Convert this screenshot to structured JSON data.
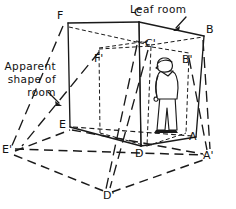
{
  "figure": {
    "type": "perspective-geometry-diagram",
    "background_color": "#ffffff",
    "ink_color": "#1a1a1a",
    "annotations": {
      "leaf_room": {
        "label": "Leaf room",
        "arrow": "points down-left to the ceiling edge near corner C-B"
      },
      "apparent_shape": {
        "line1": "Apparent",
        "line2": "shape of",
        "line3": "room",
        "arrow": "points down-right to the dashed projected outline"
      }
    },
    "vertices": [
      {
        "id": "C",
        "label": "C",
        "x": 139,
        "y": 22,
        "kind": "true-room-ceiling-back"
      },
      {
        "id": "F",
        "label": "F",
        "x": 68,
        "y": 23,
        "kind": "true-room-ceiling-left"
      },
      {
        "id": "B",
        "label": "B",
        "x": 204,
        "y": 36,
        "kind": "true-room-ceiling-right"
      },
      {
        "id": "E",
        "label": "E",
        "x": 70,
        "y": 127,
        "kind": "true-room-floor-left"
      },
      {
        "id": "D",
        "label": "D",
        "x": 141,
        "y": 146,
        "kind": "true-room-floor-back"
      },
      {
        "id": "A",
        "label": "A",
        "x": 196,
        "y": 137,
        "kind": "true-room-floor-right"
      },
      {
        "id": "Fp",
        "label": "F'",
        "x": 101,
        "y": 54,
        "kind": "projected-ceiling-left"
      },
      {
        "id": "Cp",
        "label": "C'",
        "x": 151,
        "y": 47,
        "kind": "projected-ceiling-back"
      },
      {
        "id": "Bp",
        "label": "B'",
        "x": 188,
        "y": 57,
        "kind": "projected-ceiling-right"
      },
      {
        "id": "Ep",
        "label": "E'",
        "x": 11,
        "y": 152,
        "kind": "apparent-floor-left"
      },
      {
        "id": "Dp",
        "label": "D'",
        "x": 109,
        "y": 194,
        "kind": "apparent-floor-back"
      },
      {
        "id": "Ap",
        "label": "A'",
        "x": 208,
        "y": 156,
        "kind": "apparent-floor-right"
      }
    ],
    "person": {
      "name": "observer-figure",
      "description": "standing man in profile facing right, inside the room near corner A"
    }
  }
}
